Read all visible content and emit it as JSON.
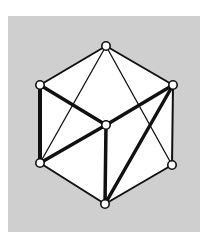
{
  "diagram": {
    "type": "graph",
    "colors": {
      "background": "#cfcfcf",
      "face_fill": "#ffffff",
      "stroke": "#111111",
      "vertex_fill": "#ffffff"
    },
    "vertices": [
      {
        "id": "T",
        "x": 106,
        "y": 46
      },
      {
        "id": "UL",
        "x": 40,
        "y": 85
      },
      {
        "id": "UR",
        "x": 173,
        "y": 85
      },
      {
        "id": "C",
        "x": 106,
        "y": 125
      },
      {
        "id": "LL",
        "x": 40,
        "y": 163
      },
      {
        "id": "LR",
        "x": 172,
        "y": 165
      },
      {
        "id": "B",
        "x": 105,
        "y": 204
      }
    ],
    "edges": [
      {
        "from": "T",
        "to": "UL",
        "weight": 2
      },
      {
        "from": "T",
        "to": "UR",
        "weight": 2
      },
      {
        "from": "UR",
        "to": "LR",
        "weight": 2
      },
      {
        "from": "LR",
        "to": "B",
        "weight": 2
      },
      {
        "from": "B",
        "to": "LL",
        "weight": 2
      },
      {
        "from": "UL",
        "to": "LL",
        "weight": 4
      },
      {
        "from": "UL",
        "to": "C",
        "weight": 3.5
      },
      {
        "from": "C",
        "to": "UR",
        "weight": 3.5
      },
      {
        "from": "C",
        "to": "LL",
        "weight": 3.5
      },
      {
        "from": "C",
        "to": "B",
        "weight": 3.5
      },
      {
        "from": "UR",
        "to": "B",
        "weight": 3.5
      },
      {
        "from": "T",
        "to": "LL",
        "weight": 1.3
      },
      {
        "from": "T",
        "to": "LR",
        "weight": 1.3
      }
    ]
  }
}
